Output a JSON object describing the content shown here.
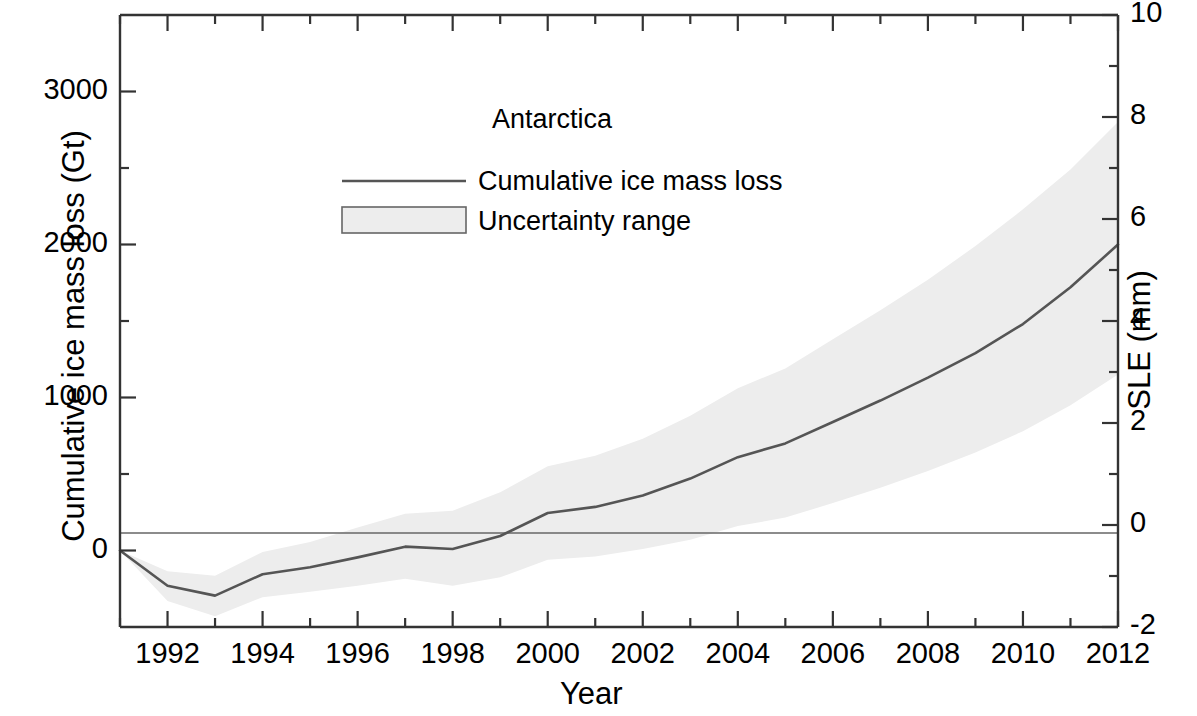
{
  "chart_data": {
    "type": "line",
    "title": "",
    "xlabel": "Year",
    "ylabel": "Cumulative ice mass loss (Gt)",
    "y2label": "SLE (mm)",
    "xlim": [
      1991,
      2012
    ],
    "ylim": [
      -500,
      3500
    ],
    "y2lim": [
      -2,
      10
    ],
    "grid": false,
    "xticks": [
      1992,
      1994,
      1996,
      1998,
      2000,
      2002,
      2004,
      2006,
      2008,
      2010,
      2012
    ],
    "xticklabels": [
      "1992",
      "1994",
      "1996",
      "1998",
      "2000",
      "2002",
      "2004",
      "2006",
      "2008",
      "2010",
      "2012"
    ],
    "xminorticks": [
      1991,
      1993,
      1995,
      1997,
      1999,
      2001,
      2003,
      2005,
      2007,
      2009,
      2011
    ],
    "yticks": [
      0,
      1000,
      2000,
      3000
    ],
    "yticklabels": [
      "0",
      "1000",
      "2000",
      "3000"
    ],
    "yminorticks": [
      -500,
      500,
      1500,
      2500,
      3500
    ],
    "y2ticks": [
      -2,
      0,
      2,
      4,
      6,
      8,
      10
    ],
    "y2ticklabels": [
      "-2",
      "0",
      "2",
      "4",
      "6",
      "8",
      "10"
    ],
    "y2minorticks": [
      -1,
      1,
      3,
      5,
      7,
      9
    ],
    "legend_position": "upper center",
    "legend_title": "Antarctica",
    "series": [
      {
        "name": "Cumulative ice mass loss",
        "type": "line",
        "color": "#555555",
        "x": [
          1991,
          1992,
          1993,
          1994,
          1995,
          1996,
          1997,
          1998,
          1999,
          2000,
          2001,
          2002,
          2003,
          2004,
          2005,
          2006,
          2007,
          2008,
          2009,
          2010,
          2011,
          2012
        ],
        "values": [
          0,
          -230,
          -295,
          -155,
          -110,
          -45,
          25,
          10,
          95,
          245,
          285,
          360,
          470,
          610,
          700,
          840,
          980,
          1130,
          1290,
          1480,
          1720,
          2000
        ]
      },
      {
        "name": "Uncertainty range",
        "type": "band",
        "color": "#ededed",
        "x": [
          1991,
          1992,
          1993,
          1994,
          1995,
          1996,
          1997,
          1998,
          1999,
          2000,
          2001,
          2002,
          2003,
          2004,
          2005,
          2006,
          2007,
          2008,
          2009,
          2010,
          2011,
          2012
        ],
        "upper": [
          0,
          -135,
          -165,
          -10,
          55,
          150,
          240,
          260,
          380,
          550,
          620,
          730,
          880,
          1060,
          1190,
          1380,
          1570,
          1770,
          1990,
          2230,
          2490,
          2800
        ],
        "lower": [
          0,
          -330,
          -430,
          -305,
          -270,
          -230,
          -185,
          -230,
          -175,
          -60,
          -40,
          10,
          70,
          160,
          215,
          310,
          410,
          520,
          640,
          780,
          950,
          1150
        ]
      }
    ]
  },
  "legend": {
    "title": "Antarctica",
    "entries": [
      {
        "label": "Cumulative ice mass loss",
        "swatch": "line"
      },
      {
        "label": "Uncertainty range",
        "swatch": "box"
      }
    ]
  },
  "axes": {
    "left_title": "Cumulative ice mass loss (Gt)",
    "right_title": "SLE (mm)",
    "bottom_title": "Year"
  },
  "colors": {
    "line": "#555555",
    "band": "#ededed",
    "band_border": "#777777",
    "axis": "#333333",
    "text": "#000000",
    "background": "#ffffff"
  }
}
